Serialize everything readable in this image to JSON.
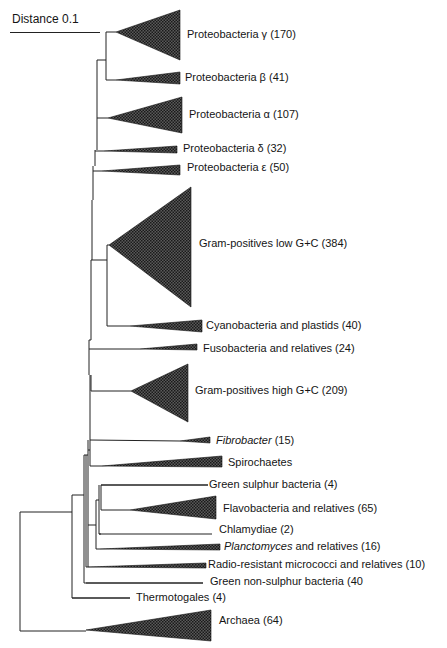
{
  "scale": {
    "label": "Distance 0.1",
    "x1": 10,
    "x2": 100,
    "y": 32
  },
  "colors": {
    "line": "#222222",
    "fill": "#3a3a3a",
    "text": "#151515"
  },
  "clades": [
    {
      "id": "proteo-gamma",
      "name": "Proteobacteria γ",
      "count": "(170)",
      "italic": false,
      "apex": [
        116,
        32
      ],
      "right": 180,
      "top": 10,
      "bottom": 60,
      "lx": 187,
      "ly": 28
    },
    {
      "id": "proteo-beta",
      "name": "Proteobacteria β",
      "count": "(41)",
      "italic": false,
      "apex": [
        116,
        80
      ],
      "right": 180,
      "top": 72,
      "bottom": 84,
      "lx": 185,
      "ly": 71
    },
    {
      "id": "proteo-alpha",
      "name": "Proteobacteria α",
      "count": "(107)",
      "italic": false,
      "apex": [
        108,
        118
      ],
      "right": 182,
      "top": 97,
      "bottom": 133,
      "lx": 189,
      "ly": 108
    },
    {
      "id": "proteo-delta",
      "name": "Proteobacteria δ",
      "count": "(32)",
      "italic": false,
      "apex": [
        104,
        151
      ],
      "right": 177,
      "top": 146,
      "bottom": 153,
      "lx": 183,
      "ly": 142
    },
    {
      "id": "proteo-epsilon",
      "name": "Proteobacteria ε",
      "count": "(50)",
      "italic": false,
      "apex": [
        102,
        171
      ],
      "right": 180,
      "top": 165,
      "bottom": 175,
      "lx": 187,
      "ly": 161
    },
    {
      "id": "gram-pos-low-gc",
      "name": "Gram-positives low G+C",
      "count": "(384)",
      "italic": false,
      "apex": [
        109,
        245
      ],
      "right": 191,
      "top": 187,
      "bottom": 307,
      "lx": 199,
      "ly": 237
    },
    {
      "id": "cyanobacteria",
      "name": "Cyanobacteria and plastids",
      "count": "(40)",
      "italic": false,
      "apex": [
        130,
        326
      ],
      "right": 202,
      "top": 320,
      "bottom": 332,
      "lx": 206,
      "ly": 319
    },
    {
      "id": "fusobacteria",
      "name": "Fusobacteria and relatives",
      "count": "(24)",
      "italic": false,
      "apex": [
        140,
        349
      ],
      "right": 197,
      "top": 344,
      "bottom": 350,
      "lx": 203,
      "ly": 342
    },
    {
      "id": "gram-pos-high-gc",
      "name": "Gram-positives high G+C",
      "count": "(209)",
      "italic": false,
      "apex": [
        131,
        391
      ],
      "right": 188,
      "top": 364,
      "bottom": 422,
      "lx": 195,
      "ly": 384
    },
    {
      "id": "fibrobacter",
      "name": "Fibrobacter",
      "count": "(15)",
      "italic": true,
      "apex": [
        180,
        441
      ],
      "right": 210,
      "top": 437,
      "bottom": 443,
      "lx": 216,
      "ly": 434
    },
    {
      "id": "spirochaetes",
      "name": "Spirochaetes",
      "count": "",
      "italic": false,
      "apex": [
        102,
        466
      ],
      "right": 222,
      "top": 456,
      "bottom": 467,
      "lx": 228,
      "ly": 456
    },
    {
      "id": "green-sulphur",
      "name": "Green sulphur bacteria",
      "count": "(4)",
      "italic": false,
      "line": true,
      "apex": [
        101,
        485
      ],
      "right": 208,
      "lx": 209,
      "ly": 478
    },
    {
      "id": "flavobacteria",
      "name": "Flavobacteria and relatives",
      "count": "(65)",
      "italic": false,
      "apex": [
        130,
        510
      ],
      "right": 216,
      "top": 496,
      "bottom": 519,
      "lx": 223,
      "ly": 502
    },
    {
      "id": "chlamydiae",
      "name": "Chlamydiae",
      "count": "(2)",
      "italic": false,
      "line": true,
      "apex": [
        99,
        534
      ],
      "right": 212,
      "lx": 219,
      "ly": 523
    },
    {
      "id": "planctomyces",
      "name": "Planctomyces",
      "count": "and relatives (16)",
      "italic": true,
      "apex": [
        100,
        549
      ],
      "right": 220,
      "top": 544,
      "bottom": 550,
      "lx": 224,
      "ly": 540
    },
    {
      "id": "radio-resistant",
      "name": "Radio-resistant micrococci and relatives",
      "count": "(10)",
      "italic": false,
      "apex": [
        88,
        567
      ],
      "right": 206,
      "top": 563,
      "bottom": 568,
      "lx": 208,
      "ly": 558
    },
    {
      "id": "green-non-sulphur",
      "name": "Green non-sulphur bacteria",
      "count": "(40",
      "italic": false,
      "line": true,
      "apex": [
        86,
        583
      ],
      "right": 203,
      "lx": 210,
      "ly": 575
    },
    {
      "id": "thermotogales",
      "name": "Thermotogales",
      "count": "(4)",
      "italic": false,
      "line": true,
      "apex": [
        72,
        598
      ],
      "right": 130,
      "lx": 136,
      "ly": 591
    },
    {
      "id": "archaea",
      "name": "Archaea",
      "count": "(64)",
      "italic": false,
      "apex": [
        86,
        630
      ],
      "right": 211,
      "top": 610,
      "bottom": 641,
      "lx": 219,
      "ly": 614
    }
  ],
  "branches": [
    [
      20,
      512,
      20,
      631
    ],
    [
      20,
      631,
      86,
      631
    ],
    [
      20,
      512,
      72,
      512
    ],
    [
      72,
      495,
      72,
      598
    ],
    [
      72,
      598,
      130,
      598
    ],
    [
      72,
      495,
      84,
      495
    ],
    [
      84,
      455,
      84,
      583
    ],
    [
      84,
      583,
      203,
      583
    ],
    [
      86,
      455,
      86,
      567
    ],
    [
      86,
      567,
      88,
      567
    ],
    [
      84,
      455,
      88,
      455
    ],
    [
      88,
      440,
      88,
      567
    ],
    [
      96,
      500,
      96,
      549
    ],
    [
      96,
      549,
      100,
      549
    ],
    [
      96,
      500,
      99,
      500
    ],
    [
      99,
      485,
      99,
      534
    ],
    [
      99,
      534,
      101,
      534
    ],
    [
      101,
      485,
      101,
      510
    ],
    [
      101,
      485,
      208,
      485
    ],
    [
      101,
      510,
      130,
      510
    ],
    [
      88,
      525,
      96,
      525
    ],
    [
      90,
      440,
      90,
      466
    ],
    [
      90,
      466,
      102,
      466
    ],
    [
      90,
      440,
      180,
      441
    ],
    [
      88,
      450,
      90,
      450
    ],
    [
      90,
      375,
      90,
      440
    ],
    [
      91,
      375,
      91,
      391
    ],
    [
      91,
      391,
      131,
      391
    ],
    [
      89,
      340,
      89,
      375
    ],
    [
      89,
      349,
      140,
      349
    ],
    [
      91,
      260,
      91,
      340
    ],
    [
      91,
      260,
      107,
      260
    ],
    [
      91,
      340,
      89,
      340
    ],
    [
      107,
      245,
      107,
      326
    ],
    [
      107,
      326,
      130,
      326
    ],
    [
      107,
      245,
      109,
      245
    ],
    [
      92,
      200,
      92,
      260
    ],
    [
      93,
      166,
      93,
      200
    ],
    [
      93,
      171,
      102,
      171
    ],
    [
      95,
      150,
      95,
      166
    ],
    [
      95,
      151,
      104,
      151
    ],
    [
      97,
      60,
      97,
      150
    ],
    [
      97,
      118,
      108,
      118
    ],
    [
      106,
      32,
      106,
      80
    ],
    [
      106,
      60,
      97,
      60
    ],
    [
      106,
      32,
      116,
      32
    ],
    [
      106,
      80,
      116,
      80
    ]
  ]
}
